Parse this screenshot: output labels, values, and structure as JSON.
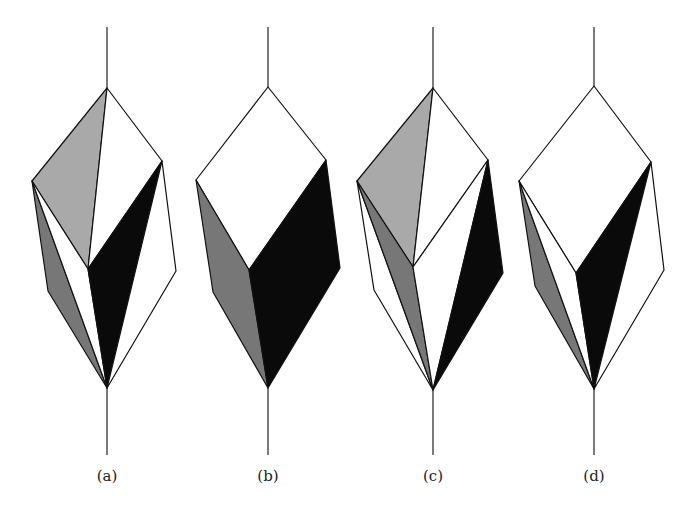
{
  "figure": {
    "panels": [
      {
        "id": "a",
        "label": "(a)",
        "faces": [
          {
            "name": "upper-left-face",
            "shade": "light"
          },
          {
            "name": "upper-right-face",
            "shade": "white"
          },
          {
            "name": "outer-left-face",
            "shade": "dark"
          },
          {
            "name": "inner-left-face",
            "shade": "white"
          },
          {
            "name": "inner-right-face",
            "shade": "black"
          },
          {
            "name": "outer-right-face",
            "shade": "white"
          }
        ]
      },
      {
        "id": "b",
        "label": "(b)",
        "faces": [
          {
            "name": "top-face",
            "shade": "white"
          },
          {
            "name": "left-face",
            "shade": "dark"
          },
          {
            "name": "right-face",
            "shade": "black"
          }
        ]
      },
      {
        "id": "c",
        "label": "(c)",
        "faces": [
          {
            "name": "upper-left-face",
            "shade": "light"
          },
          {
            "name": "upper-right-face",
            "shade": "white"
          },
          {
            "name": "outer-left-face",
            "shade": "white"
          },
          {
            "name": "inner-left-face",
            "shade": "dark"
          },
          {
            "name": "inner-right-face",
            "shade": "white"
          },
          {
            "name": "outer-right-face",
            "shade": "black"
          }
        ]
      },
      {
        "id": "d",
        "label": "(d)",
        "faces": [
          {
            "name": "top-face",
            "shade": "white"
          },
          {
            "name": "outer-left-face",
            "shade": "dark"
          },
          {
            "name": "inner-left-face",
            "shade": "white"
          },
          {
            "name": "inner-right-face",
            "shade": "black"
          },
          {
            "name": "outer-right-face",
            "shade": "white"
          }
        ]
      }
    ],
    "shades": {
      "white": "#ffffff",
      "light": "#a9a9a9",
      "dark": "#777777",
      "black": "#0a0a0a"
    }
  }
}
